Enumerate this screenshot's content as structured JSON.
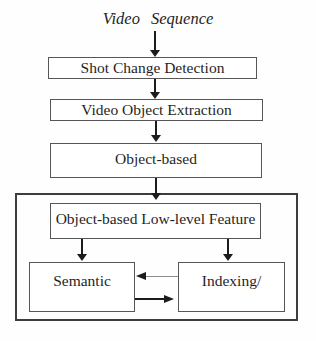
{
  "diagram": {
    "title": "Video Sequence",
    "nodes": {
      "shot_change_detection": "Shot Change Detection",
      "video_object_extraction": "Video Object Extraction",
      "object_based": "Object-based",
      "object_based_low_level_feature": "Object-based Low-level Feature",
      "semantic": "Semantic",
      "indexing": "Indexing/"
    },
    "colors": {
      "background": "#fefefe",
      "box_border": "#565656",
      "outer_border": "#3d3d3d",
      "text": "#1f1f1f",
      "arrow": "#1c1c1c",
      "arrow_light": "#8d8d8d"
    }
  }
}
